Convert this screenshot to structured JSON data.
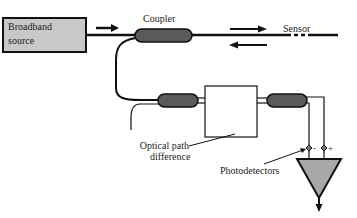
{
  "diagram": {
    "type": "fiber-optic interferometric sensor schematic",
    "source": {
      "label_line1": "Broadband",
      "label_line2": "source"
    },
    "coupler_label": "Coupler",
    "sensor_label": "Sensor",
    "optical_path_label_line1": "Optical path",
    "optical_path_label_line2": "difference",
    "photodetectors_label": "Photodetectors",
    "detector_minus": "-",
    "detector_plus": "+",
    "colors": {
      "source_fill": "#c8c8c8",
      "coupler_fill": "#5a5a5a",
      "amplifier_fill": "#a8a8a8",
      "line": "#111111"
    }
  }
}
